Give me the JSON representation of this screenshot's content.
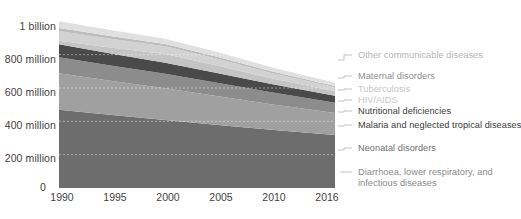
{
  "chart_data": {
    "type": "area",
    "stacked": true,
    "title": "",
    "xlabel": "",
    "ylabel": "",
    "x": [
      1990,
      1995,
      2000,
      2005,
      2010,
      2016
    ],
    "xlim": [
      1990,
      2016
    ],
    "ylim": [
      0,
      1080
    ],
    "y_unit": "millions",
    "grid": true,
    "legend_position": "right",
    "axis": {
      "x_ticks": [
        "1990",
        "1995",
        "2000",
        "2005",
        "2010",
        "2016"
      ],
      "y_ticks": [
        "0",
        "200 million",
        "400 million",
        "600 million",
        "800 million",
        "1 billion"
      ],
      "y_tick_values": [
        0,
        200,
        400,
        600,
        800,
        1000
      ]
    },
    "series": [
      {
        "name": "Diarrhoea, lower respiratory, and infectious diseases",
        "color": "#6d6d6d",
        "label_color": "#8a8a8a",
        "values": [
          470,
          438,
          408,
          378,
          350,
          318
        ]
      },
      {
        "name": "Neonatal disorders",
        "color": "#a0a0a0",
        "label_color": "#7a7a7a",
        "values": [
          218,
          204,
          190,
          172,
          152,
          132
        ]
      },
      {
        "name": "Malaria and neglected tropical diseases",
        "color": "#8c8c8c",
        "label_color": "#4a4a4a",
        "values": [
          96,
          92,
          88,
          80,
          72,
          62
        ]
      },
      {
        "name": "Nutritional deficiencies",
        "color": "#4a4a4a",
        "label_color": "#3a3a3a",
        "values": [
          78,
          72,
          66,
          58,
          50,
          42
        ]
      },
      {
        "name": "HIV/AIDS",
        "color": "#c4c4c4",
        "label_color": "#b8b8b8",
        "values": [
          22,
          36,
          52,
          46,
          34,
          26
        ]
      },
      {
        "name": "Tuberculosis",
        "color": "#d2d2d2",
        "label_color": "#c2c2c2",
        "values": [
          58,
          52,
          46,
          40,
          32,
          24
        ]
      },
      {
        "name": "Maternal disorders",
        "color": "#bcbcbc",
        "label_color": "#8f8f8f",
        "values": [
          18,
          16,
          14,
          12,
          10,
          8
        ]
      },
      {
        "name": "Other communicable diseases",
        "color": "#e0e0e0",
        "label_color": "#b5b5b5",
        "values": [
          40,
          36,
          32,
          28,
          24,
          20
        ]
      }
    ],
    "legend_entries": [
      {
        "label": "Other communicable diseases",
        "color": "#b5b5b5"
      },
      {
        "label": "Maternal disorders",
        "color": "#8f8f8f"
      },
      {
        "label": "Tuberculosis",
        "color": "#c6c6c6"
      },
      {
        "label": "HIV/AIDS",
        "color": "#c6c6c6"
      },
      {
        "label": "Nutritional deficiencies",
        "color": "#3a3a3a"
      },
      {
        "label": "Malaria and neglected tropical diseases",
        "color": "#3a3a3a"
      },
      {
        "label": "Neonatal disorders",
        "color": "#6f6f6f"
      },
      {
        "label": "Diarrhoea, lower respiratory, and",
        "label2": "infectious diseases",
        "color": "#8a8a8a"
      }
    ]
  }
}
